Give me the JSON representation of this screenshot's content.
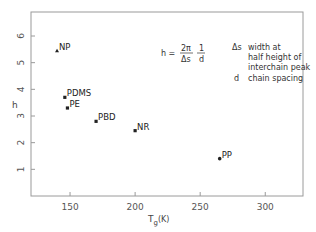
{
  "chart_data": {
    "type": "scatter",
    "title": "",
    "xlabel": "Tg(K)",
    "ylabel": "h",
    "xlim": [
      120,
      329
    ],
    "ylim": [
      0,
      6.9
    ],
    "x_ticks": [
      150,
      200,
      250,
      300
    ],
    "y_ticks": [
      1,
      2,
      3,
      4,
      5,
      6
    ],
    "grid": false,
    "legend": "none",
    "points": [
      {
        "label": "NP",
        "x": 140,
        "y": 5.45,
        "marker": "triangle"
      },
      {
        "label": "PDMS",
        "x": 146,
        "y": 3.7,
        "marker": "square"
      },
      {
        "label": "PE",
        "x": 148,
        "y": 3.3,
        "marker": "square"
      },
      {
        "label": "PBD",
        "x": 170,
        "y": 2.8,
        "marker": "square"
      },
      {
        "label": "NR",
        "x": 200,
        "y": 2.45,
        "marker": "square"
      },
      {
        "label": "PP",
        "x": 265,
        "y": 1.4,
        "marker": "circle"
      }
    ],
    "annotations": {
      "formula": {
        "lhs": "h =",
        "frac1_num": "2π",
        "frac1_den": "Δs",
        "frac2_num": "1",
        "frac2_den": "d"
      },
      "legend_text": [
        {
          "symbol": "Δs",
          "text": "width at"
        },
        {
          "symbol": "",
          "text": "half height of"
        },
        {
          "symbol": "",
          "text": "interchain peak"
        },
        {
          "symbol": "d",
          "text": "chain spacing"
        }
      ]
    }
  },
  "axes": {
    "x_tick_labels": [
      "150",
      "200",
      "250",
      "300"
    ],
    "y_tick_labels": [
      "1",
      "2",
      "3",
      "4",
      "5",
      "6"
    ],
    "x_title_main": "T",
    "x_title_sub": "g",
    "x_title_unit": "(K)",
    "y_title": "h"
  },
  "colors": {
    "axis": "#8a8a8a",
    "marker": "#222222",
    "text": "#333333"
  }
}
